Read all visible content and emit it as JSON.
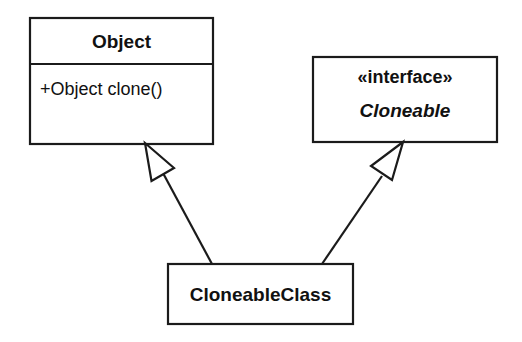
{
  "diagram": {
    "type": "uml-class-diagram",
    "background_color": "#ffffff",
    "line_color": "#1b1b1b",
    "fill_color": "#ffffff"
  },
  "classes": {
    "object": {
      "name": "Object",
      "operations": [
        {
          "text": "+Object clone()",
          "visibility": "+",
          "signature": "Object clone()"
        }
      ]
    },
    "cloneable_interface": {
      "stereotype": "«interface»",
      "name": "Cloneable"
    },
    "cloneable_class": {
      "name": "CloneableClass"
    }
  },
  "relationships": [
    {
      "kind": "generalization",
      "label": "",
      "from": "CloneableClass",
      "to": "Object"
    },
    {
      "kind": "realization",
      "label": "",
      "from": "CloneableClass",
      "to": "Cloneable"
    }
  ]
}
